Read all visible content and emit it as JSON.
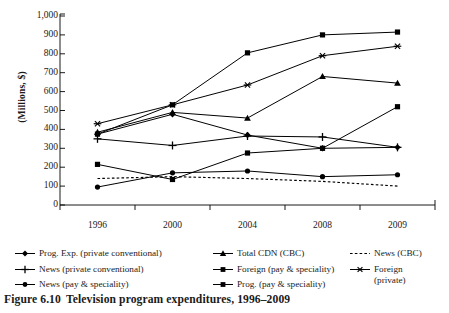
{
  "caption": {
    "number": "Figure 6.10",
    "text": "Television program expenditures, 1996–2009"
  },
  "axis": {
    "ylabel": "(Millions, $)",
    "ytick_labels": [
      "1,000",
      "900",
      "800",
      "700",
      "600",
      "500",
      "400",
      "300",
      "200",
      "100",
      "0"
    ],
    "xtick_labels": [
      "1996",
      "2000",
      "2004",
      "2008",
      "2009"
    ]
  },
  "chart_data": {
    "type": "line",
    "title": "Television program expenditures, 1996–2009",
    "xlabel": "",
    "ylabel": "(Millions, $)",
    "categories": [
      "1996",
      "2000",
      "2004",
      "2008",
      "2009"
    ],
    "ylim": [
      0,
      1000
    ],
    "ytick_step": 100,
    "grid": false,
    "legend_position": "below",
    "series": [
      {
        "name": "Prog. Exp. (private conventional)",
        "marker": "diamond",
        "line": "solid",
        "color": "#000000",
        "values": [
          375,
          480,
          370,
          300,
          305
        ]
      },
      {
        "name": "Total CDN (CBC)",
        "marker": "triangle",
        "line": "solid",
        "color": "#000000",
        "values": [
          385,
          490,
          460,
          680,
          645
        ]
      },
      {
        "name": "News (CBC)",
        "marker": "none",
        "line": "dotted",
        "color": "#000000",
        "values": [
          140,
          150,
          140,
          125,
          100
        ]
      },
      {
        "name": "News (private conventional)",
        "marker": "plus",
        "line": "solid",
        "color": "#000000",
        "values": [
          350,
          315,
          365,
          360,
          305
        ]
      },
      {
        "name": "Foreign (pay & speciality)",
        "marker": "square",
        "line": "solid",
        "color": "#000000",
        "values": [
          375,
          530,
          805,
          900,
          915
        ]
      },
      {
        "name": "Foreign (private)",
        "marker": "asterisk",
        "line": "solid",
        "color": "#000000",
        "values": [
          430,
          530,
          635,
          790,
          840
        ]
      },
      {
        "name": "News (pay & speciality)",
        "marker": "circle",
        "line": "solid",
        "color": "#000000",
        "values": [
          95,
          170,
          180,
          150,
          160
        ]
      },
      {
        "name": "Prog. (pay & speciality)",
        "marker": "square",
        "line": "solid",
        "color": "#000000",
        "values": [
          215,
          135,
          275,
          300,
          520
        ]
      }
    ]
  },
  "legend": {
    "col1": [
      {
        "label": "Prog. Exp. (private conventional)",
        "marker": "diamond",
        "line": "solid"
      },
      {
        "label": "News (private conventional)",
        "marker": "plus",
        "line": "solid"
      },
      {
        "label": "News (pay & speciality)",
        "marker": "circle",
        "line": "solid"
      }
    ],
    "col2": [
      {
        "label": "Total CDN (CBC)",
        "marker": "triangle",
        "line": "solid"
      },
      {
        "label": "Foreign (pay & speciality)",
        "marker": "square",
        "line": "solid"
      },
      {
        "label": "Prog. (pay & speciality)",
        "marker": "square",
        "line": "solid"
      }
    ],
    "col3": [
      {
        "label": "News (CBC)",
        "marker": "none",
        "line": "dotted"
      },
      {
        "label": "Foreign\n(private)",
        "marker": "asterisk",
        "line": "solid"
      }
    ]
  }
}
